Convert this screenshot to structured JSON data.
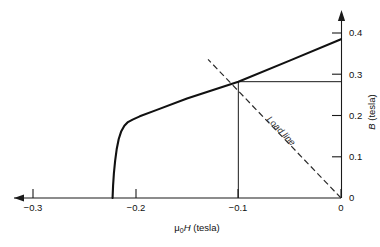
{
  "chart_data": {
    "type": "line",
    "title": "",
    "subtitle": "",
    "xlabel": "μ0H (tesla)",
    "xlabel_parts": {
      "mu": "μ",
      "sub": "0",
      "ital": "H",
      "unit": " (tesla)"
    },
    "ylabel": "B (tesla)",
    "ylabel_parts": {
      "ital": "B",
      "unit": " (tesla)"
    },
    "xlim": [
      -0.33,
      0.0
    ],
    "ylim": [
      0.0,
      0.425
    ],
    "xticks": [
      -0.3,
      -0.2,
      -0.1,
      0
    ],
    "xticklabels": [
      "−0.3",
      "−0.2",
      "−0.1",
      "0"
    ],
    "yticks": [
      0.1,
      0.2,
      0.3,
      0.4
    ],
    "yticklabels": [
      "0.1",
      "0.2",
      "0.3",
      "0.4"
    ],
    "origin_label": "0",
    "grid": false,
    "legend": "none",
    "x_axis_arrow": "left",
    "y_axis_arrow": "up",
    "series": [
      {
        "name": "demagnetization-curve",
        "style": "solid",
        "linewidth": 2.1,
        "points": [
          [
            -0.2225,
            0.0
          ],
          [
            -0.222,
            0.03
          ],
          [
            -0.2212,
            0.06
          ],
          [
            -0.22,
            0.09
          ],
          [
            -0.2185,
            0.118
          ],
          [
            -0.2165,
            0.143
          ],
          [
            -0.214,
            0.162
          ],
          [
            -0.211,
            0.175
          ],
          [
            -0.2075,
            0.184
          ],
          [
            -0.203,
            0.19
          ],
          [
            -0.196,
            0.198
          ],
          [
            -0.18,
            0.213
          ],
          [
            -0.15,
            0.241
          ],
          [
            -0.1,
            0.282
          ],
          [
            -0.05,
            0.333
          ],
          [
            0.0,
            0.385
          ]
        ]
      },
      {
        "name": "load-line",
        "style": "dashed",
        "linewidth": 1.2,
        "label": "Load line",
        "points": [
          [
            0.0,
            0.0
          ],
          [
            -0.1295,
            0.336
          ]
        ]
      }
    ],
    "annotations": [
      {
        "name": "load-line-label",
        "text": "Load line",
        "x": -0.073,
        "y": 0.175,
        "rotation": 46
      }
    ],
    "operating_point": {
      "name": "operating-point",
      "x": -0.1,
      "y": 0.282,
      "guide_to_x_axis": true,
      "guide_to_y_axis": true
    }
  },
  "figure": {
    "background_color": "#ffffff",
    "ink_color": "#111111"
  }
}
